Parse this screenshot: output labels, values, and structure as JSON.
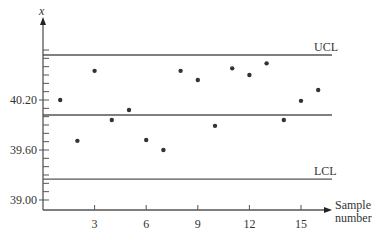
{
  "chart_data": {
    "type": "scatter",
    "title": "",
    "xlabel": "Sample number",
    "ylabel": "x̄",
    "x": [
      1,
      2,
      3,
      4,
      5,
      6,
      7,
      8,
      9,
      10,
      11,
      12,
      13,
      14,
      15,
      16
    ],
    "values": [
      40.2,
      39.71,
      40.55,
      39.96,
      40.08,
      39.72,
      39.6,
      40.55,
      40.44,
      39.89,
      40.58,
      40.5,
      40.64,
      39.96,
      40.19,
      40.32
    ],
    "xticks": [
      3,
      6,
      9,
      12,
      15
    ],
    "yticks": [
      39.0,
      39.6,
      40.2
    ],
    "ytick_labels": [
      "39.00",
      "39.60",
      "40.20"
    ],
    "yminor_step": 0.1,
    "xlim": [
      0,
      17.5
    ],
    "ylim": [
      38.9,
      41.0
    ],
    "control_limits": {
      "UCL": 40.74,
      "center": 40.02,
      "LCL": 39.25
    },
    "grid": false,
    "legend": null
  },
  "labels": {
    "ucl": "UCL",
    "lcl": "LCL",
    "y_axis": "x",
    "x_axis_line1": "Sample",
    "x_axis_line2": "number"
  },
  "colors": {
    "axis": "#555555",
    "line": "#555555",
    "point": "#333333",
    "text": "#333333"
  }
}
